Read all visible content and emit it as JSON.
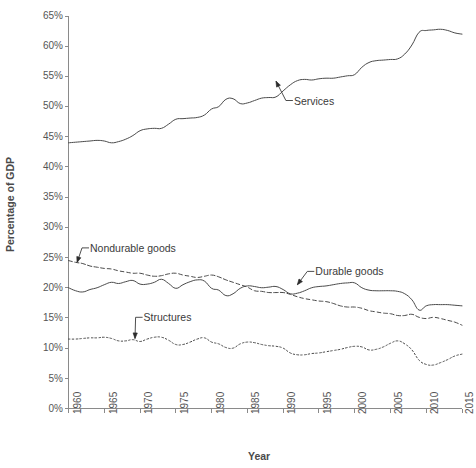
{
  "chart_data": {
    "type": "line",
    "title": "",
    "xlabel": "Year",
    "ylabel": "Percentage of GDP",
    "xlim": [
      1960,
      2015
    ],
    "ylim": [
      0,
      65
    ],
    "grid": false,
    "legend_position": "inline-annotations",
    "x_ticks": [
      "1960",
      "1965",
      "1970",
      "1975",
      "1980",
      "1985",
      "1990",
      "1995",
      "2000",
      "2005",
      "2010",
      "2015"
    ],
    "y_ticks": [
      "0%",
      "5%",
      "10%",
      "15%",
      "20%",
      "25%",
      "30%",
      "35%",
      "40%",
      "45%",
      "50%",
      "55%",
      "60%",
      "65%"
    ],
    "annotations": [
      {
        "label": "Services",
        "x": 1991.5,
        "y": 51.0,
        "point_x": 1989.0,
        "point_y": 54.2
      },
      {
        "label": "Nondurable goods",
        "x": 1963.0,
        "y": 26.6,
        "point_x": 1961.2,
        "point_y": 24.2
      },
      {
        "label": "Durable goods",
        "x": 1994.5,
        "y": 22.7,
        "point_x": 1992.0,
        "point_y": 20.5
      },
      {
        "label": "Structures",
        "x": 1970.5,
        "y": 15.1,
        "point_x": 1969.3,
        "point_y": 11.6
      }
    ],
    "x": [
      1960,
      1961,
      1962,
      1963,
      1964,
      1965,
      1966,
      1967,
      1968,
      1969,
      1970,
      1971,
      1972,
      1973,
      1974,
      1975,
      1976,
      1977,
      1978,
      1979,
      1980,
      1981,
      1982,
      1983,
      1984,
      1985,
      1986,
      1987,
      1988,
      1989,
      1990,
      1991,
      1992,
      1993,
      1994,
      1995,
      1996,
      1997,
      1998,
      1999,
      2000,
      2001,
      2002,
      2003,
      2004,
      2005,
      2006,
      2007,
      2008,
      2009,
      2010,
      2011,
      2012,
      2013,
      2014,
      2015
    ],
    "series": [
      {
        "name": "Services",
        "style": "solid",
        "values": [
          44.0,
          44.1,
          44.2,
          44.3,
          44.4,
          44.3,
          44.0,
          44.2,
          44.6,
          45.2,
          46.0,
          46.3,
          46.4,
          46.4,
          47.1,
          47.9,
          48.0,
          48.1,
          48.2,
          48.6,
          49.6,
          50.0,
          51.2,
          51.3,
          50.5,
          50.6,
          51.0,
          51.4,
          51.5,
          51.6,
          52.6,
          53.6,
          54.3,
          54.5,
          54.4,
          54.6,
          54.7,
          54.7,
          54.9,
          55.1,
          55.3,
          56.5,
          57.3,
          57.6,
          57.7,
          57.8,
          57.9,
          58.7,
          60.2,
          62.3,
          62.6,
          62.7,
          62.8,
          62.6,
          62.2,
          62.0
        ]
      },
      {
        "name": "Nondurable goods",
        "style": "dashed",
        "values": [
          24.5,
          24.2,
          24.0,
          23.6,
          23.4,
          23.2,
          23.1,
          22.8,
          22.6,
          22.4,
          22.4,
          22.1,
          21.9,
          22.0,
          22.3,
          22.4,
          22.1,
          21.9,
          21.7,
          21.9,
          22.1,
          21.8,
          21.3,
          20.9,
          20.5,
          20.1,
          19.5,
          19.4,
          19.2,
          19.2,
          19.2,
          18.9,
          18.5,
          18.2,
          18.0,
          17.8,
          17.7,
          17.4,
          17.0,
          16.8,
          16.8,
          16.6,
          16.2,
          16.0,
          15.8,
          15.7,
          15.4,
          15.4,
          15.6,
          15.1,
          14.9,
          15.1,
          14.9,
          14.6,
          14.3,
          13.8
        ]
      },
      {
        "name": "Durable goods",
        "style": "solid",
        "values": [
          20.0,
          19.5,
          19.3,
          19.7,
          20.0,
          20.5,
          20.9,
          20.7,
          21.0,
          21.2,
          20.6,
          20.6,
          20.9,
          21.4,
          20.7,
          19.9,
          20.5,
          21.0,
          21.3,
          21.1,
          19.9,
          19.6,
          18.7,
          19.0,
          19.9,
          20.3,
          20.2,
          20.0,
          20.1,
          20.2,
          19.7,
          19.0,
          19.1,
          19.5,
          20.0,
          20.2,
          20.3,
          20.5,
          20.7,
          20.8,
          20.8,
          20.0,
          19.6,
          19.5,
          19.5,
          19.5,
          19.4,
          19.0,
          18.0,
          16.3,
          17.0,
          17.2,
          17.2,
          17.2,
          17.1,
          17.0
        ]
      },
      {
        "name": "Structures",
        "style": "dotted",
        "values": [
          11.5,
          11.5,
          11.6,
          11.7,
          11.7,
          11.8,
          11.6,
          11.2,
          11.2,
          11.4,
          11.1,
          11.5,
          11.8,
          11.8,
          11.3,
          10.6,
          10.6,
          11.0,
          11.5,
          11.7,
          11.0,
          10.7,
          10.1,
          10.0,
          10.7,
          11.0,
          10.9,
          10.6,
          10.4,
          10.3,
          10.0,
          9.2,
          8.9,
          8.9,
          9.1,
          9.2,
          9.4,
          9.6,
          9.8,
          10.1,
          10.3,
          10.2,
          9.7,
          9.8,
          10.2,
          10.8,
          11.2,
          10.7,
          9.7,
          8.0,
          7.3,
          7.2,
          7.6,
          8.1,
          8.7,
          9.0
        ]
      }
    ]
  }
}
